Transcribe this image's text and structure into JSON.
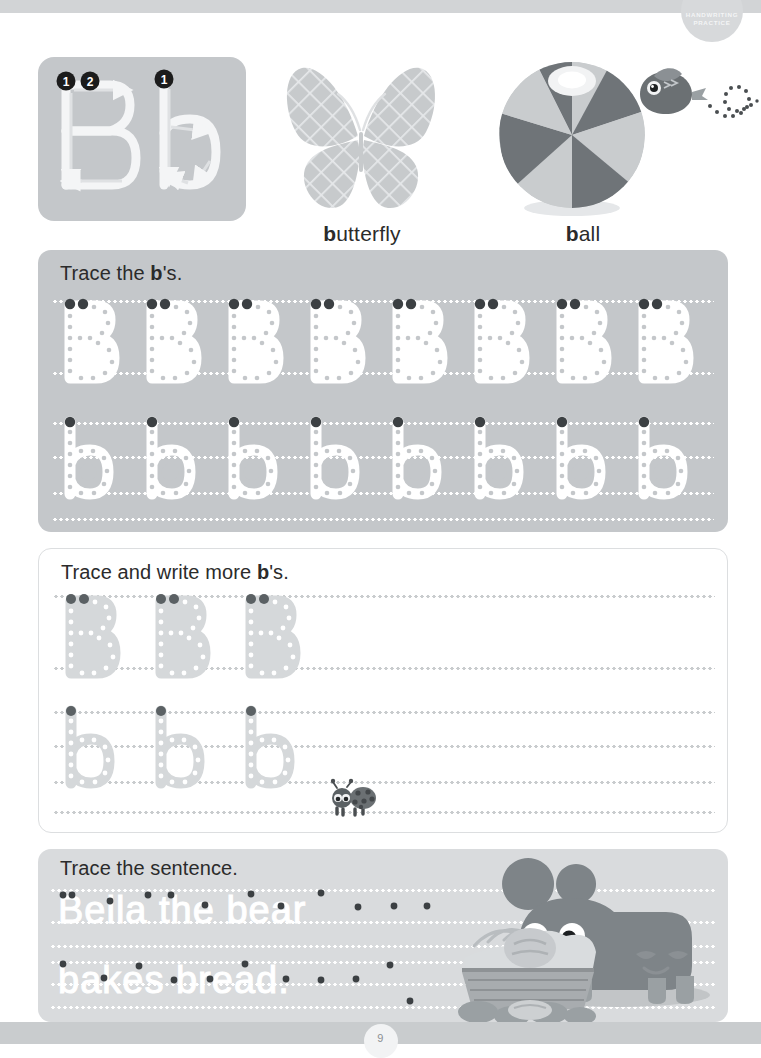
{
  "page": {
    "badge_line1": "HANDWRITING",
    "badge_line2": "PRACTICE",
    "page_number": "9",
    "letter_upper": "B",
    "letter_lower": "b",
    "background_color": "#ffffff",
    "rail_color": "#d2d4d6",
    "panel_gray": "#c4c7ca",
    "panel_light": "#d9dbdd",
    "ink_color": "#2b2b2b"
  },
  "model_box": {
    "name": "letter-formation-guide",
    "upper_strokes": [
      "1",
      "2"
    ],
    "lower_strokes": [
      "1"
    ],
    "letters": [
      "B",
      "b"
    ]
  },
  "pictures": [
    {
      "name": "butterfly",
      "word_bold": "b",
      "word_rest": "utterfly",
      "full_word": "butterfly"
    },
    {
      "name": "ball",
      "word_bold": "b",
      "word_rest": "all",
      "full_word": "ball"
    },
    {
      "name": "bird",
      "word_bold": "",
      "word_rest": "",
      "full_word": ""
    }
  ],
  "sections": [
    {
      "id": "trace-b",
      "title_pre": "Trace the ",
      "title_bold": "b",
      "title_post": "'s.",
      "title_full": "Trace the b's.",
      "rows": [
        {
          "letter": "B",
          "case": "upper",
          "count": 8,
          "style": "white-dotted"
        },
        {
          "letter": "b",
          "case": "lower",
          "count": 8,
          "style": "white-dotted"
        }
      ]
    },
    {
      "id": "trace-write-more-b",
      "title_pre": "Trace and write more ",
      "title_bold": "b",
      "title_post": "'s.",
      "title_full": "Trace and write more b's.",
      "rows": [
        {
          "letter": "B",
          "case": "upper",
          "count": 3,
          "style": "gray-dotted",
          "blank_space": true
        },
        {
          "letter": "b",
          "case": "lower",
          "count": 3,
          "style": "gray-dotted",
          "blank_space": true
        }
      ],
      "decoration": "ladybug"
    },
    {
      "id": "trace-sentence",
      "title_pre": "Trace the sentence.",
      "title_bold": "",
      "title_post": "",
      "title_full": "Trace the sentence.",
      "sentence_line1": "Bella the bear",
      "sentence_line2": "bakes bread.",
      "sentence_full": "Bella the bear bakes bread.",
      "decoration": "bear-with-bread-basket"
    }
  ]
}
